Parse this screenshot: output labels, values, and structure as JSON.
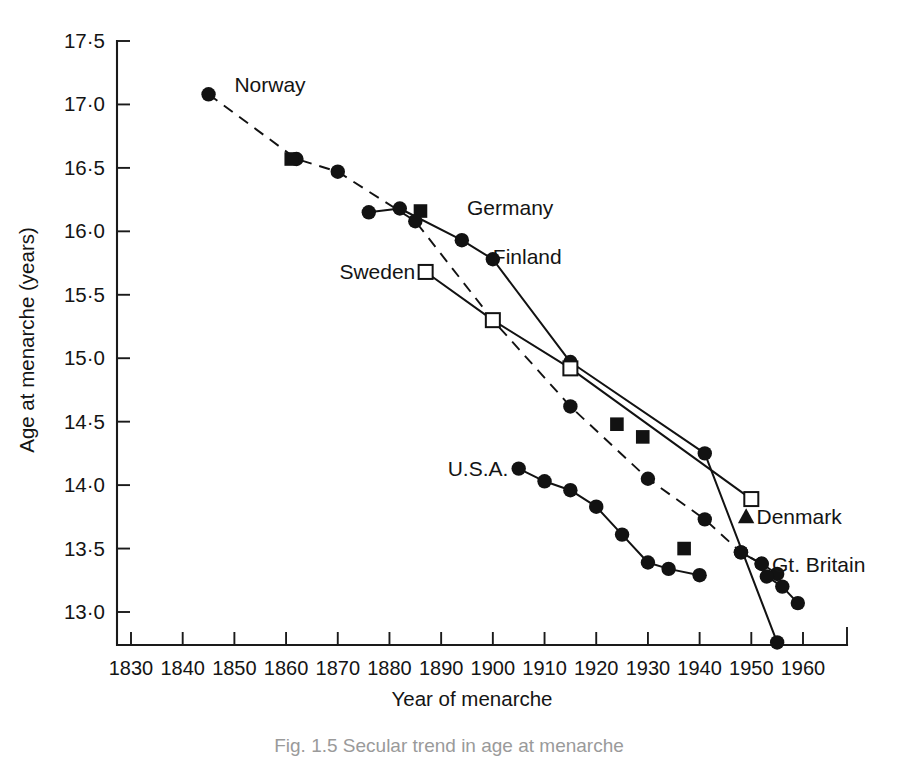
{
  "figure": {
    "caption": "Fig. 1.5  Secular trend in age at menarche",
    "background_color": "#ffffff",
    "ink_color": "#121212"
  },
  "chart_data": {
    "type": "line",
    "title": "",
    "xlabel": "Year of menarche",
    "ylabel": "Age at menarche (years)",
    "xlim": [
      1830,
      1960
    ],
    "ylim": [
      12.6,
      17.6
    ],
    "xticks": [
      1830,
      1840,
      1850,
      1860,
      1870,
      1880,
      1890,
      1900,
      1910,
      1920,
      1930,
      1940,
      1950,
      1960
    ],
    "xtick_labels": [
      "1830",
      "1840",
      "1850",
      "1860",
      "1870",
      "1880",
      "1890",
      "1900",
      "1910",
      "1920",
      "1930",
      "1940",
      "1950",
      "1960"
    ],
    "yticks": [
      13.0,
      13.5,
      14.0,
      14.5,
      15.0,
      15.5,
      16.0,
      16.5,
      17.0,
      17.5
    ],
    "ytick_labels": [
      "13·0",
      "13·5",
      "14·0",
      "14·5",
      "15·0",
      "15·5",
      "16·0",
      "16·5",
      "17·0",
      "17·5"
    ],
    "grid": false,
    "legend": "inline-series-labels",
    "series": [
      {
        "name": "Norway",
        "label": "Norway",
        "marker": "filled-circle",
        "line": "dashed",
        "label_x": 1850,
        "label_y": 17.15,
        "label_anchor": "start",
        "x": [
          1845,
          1862,
          1870,
          1885,
          1900,
          1915,
          1930,
          1941,
          1948,
          1952,
          1955
        ],
        "y": [
          17.08,
          16.57,
          16.47,
          16.08,
          15.3,
          14.62,
          14.05,
          13.73,
          13.47,
          13.38,
          13.3
        ]
      },
      {
        "name": "Germany",
        "label": "Germany",
        "marker": "filled-square",
        "line": "none",
        "label_x": 1895,
        "label_y": 16.18,
        "label_anchor": "start",
        "x": [
          1861,
          1886,
          1924,
          1929,
          1937
        ],
        "y": [
          16.57,
          16.16,
          14.48,
          14.38,
          13.5
        ]
      },
      {
        "name": "Finland",
        "label": "Finland",
        "marker": "filled-circle",
        "line": "solid",
        "label_x": 1900,
        "label_y": 15.8,
        "label_anchor": "start",
        "x": [
          1876,
          1882,
          1894,
          1900,
          1915,
          1941,
          1955
        ],
        "y": [
          16.15,
          16.18,
          15.93,
          15.78,
          14.97,
          14.25,
          12.76
        ]
      },
      {
        "name": "Sweden",
        "label": "Sweden",
        "marker": "open-square",
        "line": "solid",
        "label_x": 1885,
        "label_y": 15.68,
        "label_anchor": "end",
        "x": [
          1887,
          1900,
          1915,
          1950
        ],
        "y": [
          15.68,
          15.3,
          14.92,
          13.89
        ]
      },
      {
        "name": "Denmark",
        "label": "Denmark",
        "marker": "filled-triangle",
        "line": "none",
        "label_x": 1951,
        "label_y": 13.75,
        "label_anchor": "start",
        "x": [
          1949
        ],
        "y": [
          13.75
        ]
      },
      {
        "name": "U.S.A.",
        "label": "U.S.A.",
        "marker": "filled-circle",
        "line": "solid",
        "label_x": 1903,
        "label_y": 14.13,
        "label_anchor": "end",
        "x": [
          1905,
          1910,
          1915,
          1920,
          1925,
          1930,
          1934,
          1940
        ],
        "y": [
          14.13,
          14.03,
          13.96,
          13.83,
          13.61,
          13.39,
          13.34,
          13.29
        ]
      },
      {
        "name": "Gt. Britain",
        "label": "Gt. Britain",
        "marker": "filled-circle",
        "line": "solid",
        "label_x": 1954,
        "label_y": 13.37,
        "label_anchor": "start",
        "x": [
          1948,
          1952,
          1953,
          1956,
          1959
        ],
        "y": [
          13.47,
          13.38,
          13.28,
          13.2,
          13.07
        ]
      }
    ]
  },
  "geometry": {
    "plot_left": 117,
    "plot_right": 847,
    "plot_top": 41,
    "plot_bottom": 645,
    "x_pixel_1830": 131,
    "x_pixel_1960": 803,
    "y_pixel_17_5": 41,
    "y_pixel_13_0": 612
  }
}
